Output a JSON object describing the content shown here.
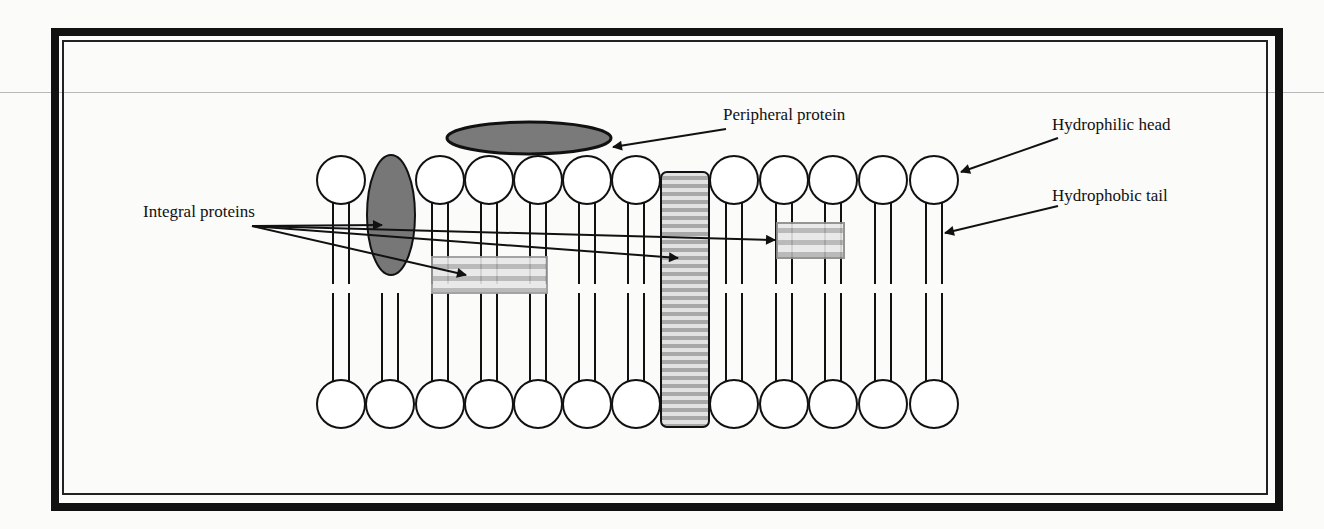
{
  "diagram": {
    "type": "cell-membrane-phospholipid-bilayer",
    "labels": {
      "peripheral_protein": "Peripheral protein",
      "hydrophilic_head": "Hydrophilic head",
      "hydrophobic_tail": "Hydrophobic tail",
      "integral_proteins": "Integral proteins"
    },
    "heads": {
      "top_row_centers_x": [
        341,
        440,
        489,
        538,
        587,
        636,
        734,
        784,
        833,
        883,
        934
      ],
      "bottom_row_centers_x": [
        341,
        390,
        440,
        489,
        538,
        587,
        636,
        734,
        784,
        833,
        883,
        934
      ],
      "top_y": 180,
      "bottom_y": 404,
      "radius": 24
    },
    "proteins": {
      "peripheral": {
        "cx": 529,
        "cy": 138,
        "rx": 82,
        "ry": 16,
        "color": "#7a7a7a"
      },
      "integral_ellipse": {
        "cx": 391,
        "cy": 215,
        "rx": 24,
        "ry": 60,
        "color": "#777777"
      },
      "channel": {
        "x": 661,
        "y": 172,
        "w": 48,
        "h": 255
      },
      "lower_left_rect": {
        "x": 432,
        "y": 257,
        "w": 115,
        "h": 36
      },
      "small_right_rect": {
        "x": 777,
        "y": 223,
        "w": 67,
        "h": 35
      }
    },
    "colors": {
      "stroke": "#111111",
      "protein_fill": "#7a7a7a",
      "stripe_dark": "#a9a9a9",
      "stripe_light": "#e4e4e4"
    }
  }
}
